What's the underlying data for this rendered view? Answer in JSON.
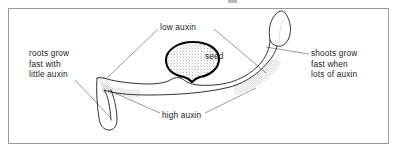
{
  "figure": {
    "kind": "biology-diagram",
    "border_color": "#9a9a9a",
    "background_color": "#ffffff",
    "ink_color": "#1d1d1d",
    "leader_line_color": "#6f6f6f"
  },
  "labels": {
    "low_auxin": "low auxin",
    "seed": "seed",
    "high_auxin": "high auxin",
    "roots_note": "roots grow\nfast with\nlittle auxin",
    "shoots_note": "shoots grow\nfast when\nlots of auxin"
  },
  "structures": {
    "seed": "seed",
    "root": "root",
    "root_tip": "root-tip",
    "shoot": "shoot",
    "shoot_tip": "shoot-tip",
    "stipple_low_surface": "high-auxin-stippling"
  }
}
